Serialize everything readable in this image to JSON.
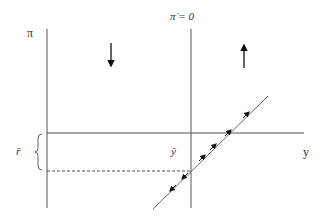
{
  "diagram": {
    "type": "phase-diagram",
    "labels": {
      "y_axis": "π",
      "x_axis": "y",
      "locus": "π̇ = 0",
      "r_bar": "r̄",
      "y_bar": "ȳ"
    },
    "colors": {
      "line": "#555555",
      "arrow": "#111111",
      "text": "#333333"
    },
    "elements": {
      "vertical_axis": {
        "x": 47,
        "y1": 29,
        "y2": 208
      },
      "locus_line": {
        "x": 191,
        "y1": 29,
        "y2": 208
      },
      "horizontal_line": {
        "y": 133,
        "x1": 47,
        "x2": 304
      },
      "dashed_line": {
        "y": 171,
        "x1": 47,
        "x2": 191
      },
      "diagonal_path": {
        "x1": 153,
        "y1": 209,
        "x2": 268,
        "y2": 96
      },
      "region_arrows": [
        {
          "direction": "down",
          "x": 111,
          "y1": 43,
          "y2": 67
        },
        {
          "direction": "up",
          "x": 244,
          "y1": 68,
          "y2": 44
        }
      ],
      "path_arrows": [
        {
          "direction": "up-right",
          "x": 248,
          "y": 113
        },
        {
          "direction": "up-right",
          "x": 230,
          "y": 131
        },
        {
          "direction": "up-right",
          "x": 215,
          "y": 145
        },
        {
          "direction": "up-right",
          "x": 204,
          "y": 157
        },
        {
          "direction": "down-left",
          "x": 183,
          "y": 177
        },
        {
          "direction": "down-left",
          "x": 171,
          "y": 189
        }
      ],
      "brace": {
        "x": 40,
        "y1": 133,
        "y2": 171
      }
    }
  }
}
